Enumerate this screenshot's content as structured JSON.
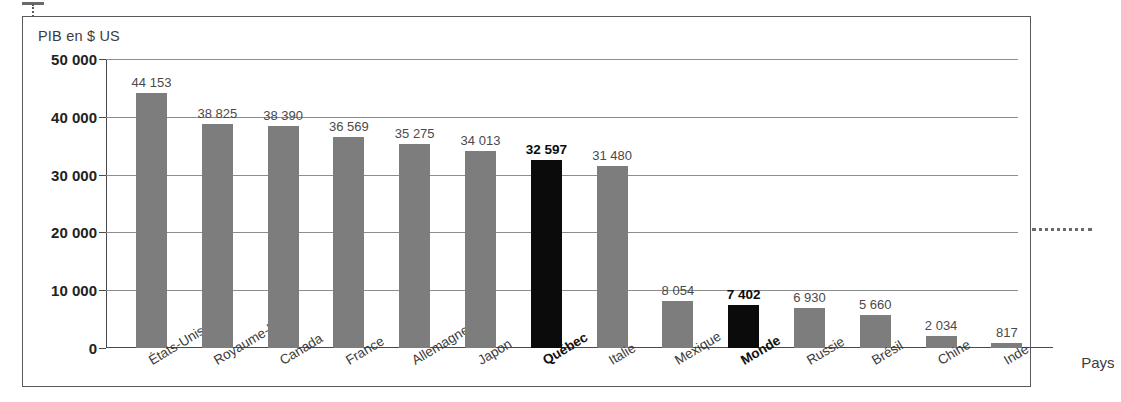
{
  "chart_data": {
    "type": "bar",
    "title": "",
    "ylabel": "PIB en $ US",
    "xlabel": "Pays",
    "ylim": [
      0,
      50000
    ],
    "yticks": [
      "0",
      "10 000",
      "20 000",
      "30 000",
      "40 000",
      "50 000"
    ],
    "ytick_values": [
      0,
      10000,
      20000,
      30000,
      40000,
      50000
    ],
    "grid": true,
    "legend": "none",
    "categories": [
      "États-Unis",
      "Royaume-Uni",
      "Canada",
      "France",
      "Allemagne",
      "Japon",
      "Québec",
      "Italie",
      "Mexique",
      "Monde",
      "Russie",
      "Brésil",
      "Chine",
      "Inde"
    ],
    "values": [
      44153,
      38825,
      38390,
      36569,
      35275,
      34013,
      32597,
      31480,
      8054,
      7402,
      6930,
      5660,
      2034,
      817
    ],
    "value_labels": [
      "44 153",
      "38 825",
      "38 390",
      "36 569",
      "35 275",
      "34 013",
      "32 597",
      "31 480",
      "8 054",
      "7 402",
      "6 930",
      "5 660",
      "2 034",
      "817"
    ],
    "highlighted": [
      false,
      false,
      false,
      false,
      false,
      false,
      true,
      false,
      false,
      true,
      false,
      false,
      false,
      false
    ],
    "colors": {
      "bar": "#7d7d7d",
      "bar_highlight": "#0b0b0b",
      "gridline": "#8d8d8d",
      "axis": "#4a4a4a",
      "text": "#3a3a3a",
      "frame": "#5a5a5a"
    }
  }
}
